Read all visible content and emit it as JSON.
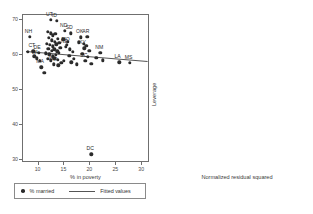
{
  "chart_data": [
    {
      "type": "scatter",
      "panel": "left",
      "title": "",
      "xlabel": "% in poverty",
      "ylabel": "",
      "xlim": [
        7.0,
        31.5
      ],
      "ylim": [
        29.0,
        71.5
      ],
      "xticks": [
        "10",
        "15",
        "20",
        "25",
        "30"
      ],
      "xtick_values": [
        10,
        15,
        20,
        25,
        30
      ],
      "yticks": [
        "70",
        "60",
        "50",
        "40",
        "30"
      ],
      "ytick_values": [
        70,
        60,
        50,
        40,
        30
      ],
      "grid": false,
      "legend_position": "below-left",
      "series": [
        {
          "name": "% married",
          "marker": "filled-circle",
          "color": "#2b2b2b",
          "points": [
            {
              "label": "NH",
              "x": 8.5,
              "y": 65.0
            },
            {
              "label": "",
              "x": 8.1,
              "y": 60.6
            },
            {
              "label": "CT",
              "x": 9.2,
              "y": 60.8
            },
            {
              "label": "DE",
              "x": 10.2,
              "y": 60.3
            },
            {
              "label": "",
              "x": 9.4,
              "y": 59.4
            },
            {
              "label": "WI",
              "x": 9.8,
              "y": 58.8
            },
            {
              "label": "",
              "x": 10.4,
              "y": 58.1
            },
            {
              "label": "MA",
              "x": 10.7,
              "y": 56.2
            },
            {
              "label": "",
              "x": 11.3,
              "y": 54.6
            },
            {
              "label": "UT",
              "x": 12.6,
              "y": 69.8
            },
            {
              "label": "ID",
              "x": 13.7,
              "y": 69.6
            },
            {
              "label": "",
              "x": 12.0,
              "y": 66.4
            },
            {
              "label": "",
              "x": 12.5,
              "y": 66.0
            },
            {
              "label": "",
              "x": 13.0,
              "y": 65.4
            },
            {
              "label": "",
              "x": 13.4,
              "y": 65.8
            },
            {
              "label": "",
              "x": 12.2,
              "y": 64.6
            },
            {
              "label": "",
              "x": 12.8,
              "y": 64.0
            },
            {
              "label": "",
              "x": 13.3,
              "y": 63.6
            },
            {
              "label": "",
              "x": 13.9,
              "y": 64.3
            },
            {
              "label": "",
              "x": 11.8,
              "y": 63.0
            },
            {
              "label": "",
              "x": 12.4,
              "y": 62.6
            },
            {
              "label": "",
              "x": 13.0,
              "y": 62.2
            },
            {
              "label": "",
              "x": 13.6,
              "y": 62.8
            },
            {
              "label": "",
              "x": 14.2,
              "y": 63.2
            },
            {
              "label": "",
              "x": 12.1,
              "y": 61.5
            },
            {
              "label": "",
              "x": 12.7,
              "y": 61.0
            },
            {
              "label": "",
              "x": 13.2,
              "y": 61.4
            },
            {
              "label": "",
              "x": 13.8,
              "y": 60.8
            },
            {
              "label": "",
              "x": 14.4,
              "y": 61.8
            },
            {
              "label": "",
              "x": 11.6,
              "y": 60.2
            },
            {
              "label": "",
              "x": 12.3,
              "y": 59.9
            },
            {
              "label": "",
              "x": 12.9,
              "y": 59.4
            },
            {
              "label": "",
              "x": 13.5,
              "y": 59.8
            },
            {
              "label": "",
              "x": 14.1,
              "y": 60.4
            },
            {
              "label": "",
              "x": 12.0,
              "y": 58.6
            },
            {
              "label": "",
              "x": 12.6,
              "y": 58.2
            },
            {
              "label": "",
              "x": 13.2,
              "y": 58.8
            },
            {
              "label": "",
              "x": 13.9,
              "y": 58.3
            },
            {
              "label": "IN",
              "x": 13.1,
              "y": 57.0
            },
            {
              "label": "IA",
              "x": 14.0,
              "y": 56.8
            },
            {
              "label": "",
              "x": 14.6,
              "y": 57.4
            },
            {
              "label": "",
              "x": 15.1,
              "y": 58.0
            },
            {
              "label": "ND",
              "x": 15.3,
              "y": 66.6
            },
            {
              "label": "SD",
              "x": 16.4,
              "y": 66.0
            },
            {
              "label": "",
              "x": 15.0,
              "y": 64.2
            },
            {
              "label": "",
              "x": 15.8,
              "y": 63.6
            },
            {
              "label": "NE",
              "x": 15.5,
              "y": 62.0
            },
            {
              "label": "",
              "x": 16.2,
              "y": 61.4
            },
            {
              "label": "MO",
              "x": 15.6,
              "y": 62.6
            },
            {
              "label": "",
              "x": 16.8,
              "y": 60.6
            },
            {
              "label": "",
              "x": 16.1,
              "y": 59.5
            },
            {
              "label": "",
              "x": 17.0,
              "y": 58.6
            },
            {
              "label": "",
              "x": 16.5,
              "y": 57.6
            },
            {
              "label": "",
              "x": 17.6,
              "y": 57.0
            },
            {
              "label": "OK",
              "x": 18.4,
              "y": 64.8
            },
            {
              "label": "AR",
              "x": 19.6,
              "y": 65.0
            },
            {
              "label": "",
              "x": 18.0,
              "y": 63.4
            },
            {
              "label": "",
              "x": 18.9,
              "y": 63.0
            },
            {
              "label": "",
              "x": 19.4,
              "y": 62.4
            },
            {
              "label": "KY",
              "x": 19.0,
              "y": 61.6
            },
            {
              "label": "",
              "x": 20.0,
              "y": 61.0
            },
            {
              "label": "",
              "x": 18.6,
              "y": 60.0
            },
            {
              "label": "",
              "x": 19.7,
              "y": 59.2
            },
            {
              "label": "SC",
              "x": 19.2,
              "y": 58.0
            },
            {
              "label": "",
              "x": 20.4,
              "y": 57.2
            },
            {
              "label": "NM",
              "x": 22.1,
              "y": 60.4
            },
            {
              "label": "",
              "x": 21.3,
              "y": 59.0
            },
            {
              "label": "",
              "x": 22.6,
              "y": 58.2
            },
            {
              "label": "LA",
              "x": 25.8,
              "y": 57.6
            },
            {
              "label": "MS",
              "x": 27.8,
              "y": 57.4
            },
            {
              "label": "DC",
              "x": 20.4,
              "y": 31.2
            }
          ]
        }
      ],
      "fitted_line": {
        "name": "Fitted values",
        "x0": 7.8,
        "y0": 60.9,
        "x1": 31.3,
        "y1": 58.0,
        "color": "#555555"
      }
    },
    {
      "type": "scatter",
      "panel": "right",
      "title": "",
      "xlabel": "Normalized residual squared",
      "ylabel": "Leverage",
      "xlim": [
        -0.035,
        0.655
      ],
      "ylim": [
        -0.004,
        0.215
      ],
      "xticks": [
        "0",
        ".2",
        ".4",
        ".6"
      ],
      "xtick_values": [
        0,
        0.2,
        0.4,
        0.6
      ],
      "yticks": [
        ".2",
        ".15",
        ".1",
        ".05",
        "0"
      ],
      "ytick_values": [
        0.2,
        0.15,
        0.1,
        0.05,
        0
      ],
      "grid": false,
      "reference_lines": {
        "horizontal_y": 0.0385,
        "vertical_x": 0.0115,
        "color": "#555555"
      },
      "series": [
        {
          "name": "leverage",
          "marker": "filled-circle",
          "color": "#2b2b2b",
          "points": [
            {
              "label": "MS",
              "x": 0.012,
              "y": 0.199
            },
            {
              "label": "LA",
              "x": 0.012,
              "y": 0.143
            },
            {
              "label": "NM",
              "x": 0.013,
              "y": 0.078
            },
            {
              "label": "DC",
              "x": 0.585,
              "y": 0.04
            },
            {
              "label": "",
              "x": 0.016,
              "y": 0.07
            },
            {
              "label": "",
              "x": 0.02,
              "y": 0.066
            },
            {
              "label": "",
              "x": 0.014,
              "y": 0.064
            },
            {
              "label": "",
              "x": 0.024,
              "y": 0.062
            },
            {
              "label": "",
              "x": 0.018,
              "y": 0.06
            },
            {
              "label": "",
              "x": 0.013,
              "y": 0.058
            },
            {
              "label": "",
              "x": 0.026,
              "y": 0.056
            },
            {
              "label": "",
              "x": 0.019,
              "y": 0.054
            },
            {
              "label": "",
              "x": 0.015,
              "y": 0.052
            },
            {
              "label": "",
              "x": 0.029,
              "y": 0.05
            },
            {
              "label": "",
              "x": 0.021,
              "y": 0.048
            },
            {
              "label": "",
              "x": 0.013,
              "y": 0.047
            },
            {
              "label": "",
              "x": 0.025,
              "y": 0.045
            },
            {
              "label": "",
              "x": 0.017,
              "y": 0.044
            },
            {
              "label": "",
              "x": 0.031,
              "y": 0.042
            },
            {
              "label": "",
              "x": 0.012,
              "y": 0.041
            },
            {
              "label": "",
              "x": 0.022,
              "y": 0.04
            },
            {
              "label": "",
              "x": 0.016,
              "y": 0.039
            },
            {
              "label": "",
              "x": 0.028,
              "y": 0.038
            },
            {
              "label": "",
              "x": 0.019,
              "y": 0.037
            },
            {
              "label": "",
              "x": 0.013,
              "y": 0.036
            },
            {
              "label": "",
              "x": 0.024,
              "y": 0.035
            },
            {
              "label": "",
              "x": 0.034,
              "y": 0.034
            },
            {
              "label": "",
              "x": 0.015,
              "y": 0.033
            },
            {
              "label": "",
              "x": 0.02,
              "y": 0.032
            },
            {
              "label": "",
              "x": 0.027,
              "y": 0.031
            },
            {
              "label": "",
              "x": 0.012,
              "y": 0.03
            },
            {
              "label": "",
              "x": 0.018,
              "y": 0.029
            },
            {
              "label": "",
              "x": 0.023,
              "y": 0.028
            },
            {
              "label": "",
              "x": 0.03,
              "y": 0.027
            },
            {
              "label": "",
              "x": 0.014,
              "y": 0.026
            },
            {
              "label": "",
              "x": 0.021,
              "y": 0.025
            },
            {
              "label": "",
              "x": 0.026,
              "y": 0.024
            },
            {
              "label": "",
              "x": 0.016,
              "y": 0.023
            },
            {
              "label": "",
              "x": 0.011,
              "y": 0.022
            },
            {
              "label": "",
              "x": 0.022,
              "y": 0.021
            },
            {
              "label": "",
              "x": 0.028,
              "y": 0.02
            },
            {
              "label": "",
              "x": 0.017,
              "y": 0.019
            },
            {
              "label": "",
              "x": 0.013,
              "y": 0.018
            },
            {
              "label": "",
              "x": 0.024,
              "y": 0.017
            },
            {
              "label": "",
              "x": 0.019,
              "y": 0.016
            },
            {
              "label": "",
              "x": 0.015,
              "y": 0.015
            },
            {
              "label": "",
              "x": 0.026,
              "y": 0.014
            },
            {
              "label": "",
              "x": 0.012,
              "y": 0.013
            },
            {
              "label": "",
              "x": 0.02,
              "y": 0.012
            },
            {
              "label": "",
              "x": 0.016,
              "y": 0.011
            }
          ]
        }
      ]
    }
  ],
  "legend": {
    "marker_label": "% married",
    "line_label": "Fitted values"
  }
}
